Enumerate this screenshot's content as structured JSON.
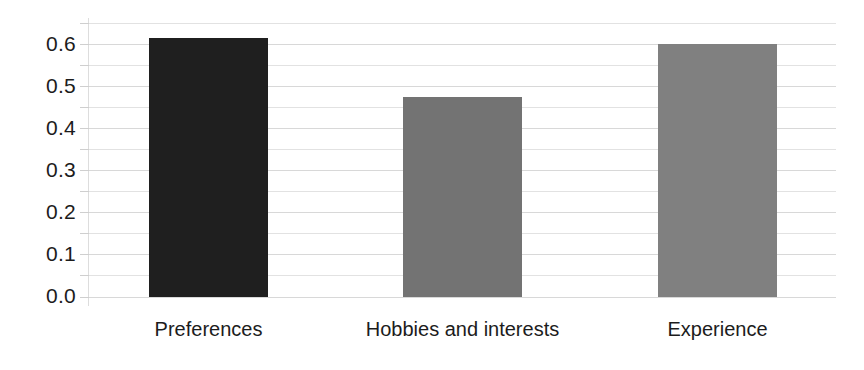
{
  "chart_data": {
    "type": "bar",
    "title": "",
    "subtitle": "",
    "xlabel": "",
    "ylabel": "",
    "categories": [
      "Preferences",
      "Hobbies and interests",
      "Experience"
    ],
    "values": [
      0.615,
      0.475,
      0.6
    ],
    "series": [
      {
        "name": "",
        "values": [
          0.615,
          0.475,
          0.6
        ],
        "colors": [
          "#1f1f1f",
          "#737373",
          "#808080"
        ]
      }
    ],
    "ylim": [
      0.0,
      0.65
    ],
    "y_major_ticks": [
      "0.0",
      "0.1",
      "0.2",
      "0.3",
      "0.4",
      "0.5",
      "0.6"
    ],
    "y_major_values": [
      0.0,
      0.1,
      0.2,
      0.3,
      0.4,
      0.5,
      0.6
    ],
    "y_minor_values": [
      0.05,
      0.15,
      0.25,
      0.35,
      0.45,
      0.55,
      0.65
    ],
    "grid": "horizontal",
    "legend": "none",
    "annotations": []
  },
  "colors": {
    "bar_dark": "#1f1f1f",
    "bar_mid_gray": "#737373",
    "bar_light_gray": "#808080",
    "gridline_major": "#d8d8d8",
    "gridline_minor": "#e2e2e2",
    "axis_line": "#dddddd",
    "text": "#1c1c1c",
    "background": "#ffffff"
  }
}
